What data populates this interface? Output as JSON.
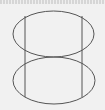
{
  "diagram": {
    "stroke_color": "#555555",
    "background_color": "#f1f1f1",
    "upper_ellipse": {
      "cx": 53.5,
      "cy": 34,
      "rx": 40.5,
      "ry": 23
    },
    "lower_ellipse": {
      "cx": 54,
      "cy": 80.5,
      "rx": 41,
      "ry": 23.5
    },
    "vertical_lines": [
      {
        "x": 25,
        "y1": 16,
        "y2": 97
      },
      {
        "x": 82,
        "y1": 16,
        "y2": 97
      }
    ]
  }
}
